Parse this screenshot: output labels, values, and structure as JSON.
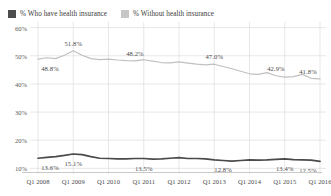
{
  "legend": {
    "items": [
      {
        "label": "% Who have health insurance",
        "color": "#4c4c4c",
        "icon": "square-swatch-icon"
      },
      {
        "label": "% Without health insurance",
        "color": "#c6c6c6",
        "icon": "square-swatch-icon"
      }
    ]
  },
  "axes": {
    "y_ticks": [
      "10%",
      "20%",
      "30%",
      "40%",
      "50%",
      "60%"
    ],
    "x_ticks": [
      "Q1 2008",
      "Q1 2009",
      "Q1 2010",
      "Q1 2011",
      "Q1 2012",
      "Q1 2013",
      "Q1 2014",
      "Q1 2015",
      "Q1 2016"
    ]
  },
  "chart_data": {
    "type": "line",
    "title": "",
    "xlabel": "",
    "ylabel": "",
    "ylim": [
      8,
      62
    ],
    "grid": true,
    "legend_position": "top-left",
    "categories": [
      "Q1 2008",
      "Q2 2008",
      "Q3 2008",
      "Q4 2008",
      "Q1 2009",
      "Q2 2009",
      "Q3 2009",
      "Q4 2009",
      "Q1 2010",
      "Q2 2010",
      "Q3 2010",
      "Q4 2010",
      "Q1 2011",
      "Q2 2011",
      "Q3 2011",
      "Q4 2011",
      "Q1 2012",
      "Q2 2012",
      "Q3 2012",
      "Q4 2012",
      "Q1 2013",
      "Q2 2013",
      "Q3 2013",
      "Q4 2013",
      "Q1 2014",
      "Q2 2014",
      "Q3 2014",
      "Q4 2014",
      "Q1 2015",
      "Q2 2015",
      "Q3 2015",
      "Q4 2015",
      "Q1 2016"
    ],
    "series": [
      {
        "name": "% Without health insurance",
        "color": "#c0c0c0",
        "values": [
          48.8,
          49.3,
          49.0,
          50.2,
          51.8,
          50.2,
          49.0,
          48.6,
          48.8,
          48.5,
          48.3,
          48.2,
          48.6,
          48.1,
          47.6,
          47.5,
          47.8,
          47.4,
          47.0,
          46.8,
          47.0,
          46.2,
          45.4,
          44.5,
          43.6,
          43.4,
          44.0,
          42.9,
          42.4,
          42.6,
          43.4,
          42.0,
          41.8
        ]
      },
      {
        "name": "% Who have health insurance",
        "color": "#4a4a4a",
        "values": [
          13.6,
          13.9,
          14.2,
          14.6,
          15.1,
          14.9,
          14.2,
          13.6,
          13.5,
          13.4,
          13.4,
          13.5,
          13.5,
          13.3,
          13.4,
          13.6,
          13.8,
          13.5,
          13.5,
          13.4,
          13.0,
          12.8,
          12.6,
          12.8,
          13.0,
          12.9,
          13.0,
          13.2,
          13.4,
          13.1,
          13.0,
          12.9,
          12.5
        ]
      }
    ],
    "annotations": [
      {
        "text": "48.8%",
        "series": "% Without health insurance",
        "category": "Q1 2008",
        "value": 48.8
      },
      {
        "text": "51.8%",
        "series": "% Without health insurance",
        "category": "Q1 2009",
        "value": 51.8
      },
      {
        "text": "48.2%",
        "series": "% Without health insurance",
        "category": "Q4 2010",
        "value": 48.2
      },
      {
        "text": "47.0%",
        "series": "% Without health insurance",
        "category": "Q1 2013",
        "value": 47.0
      },
      {
        "text": "42.9%",
        "series": "% Without health insurance",
        "category": "Q4 2014",
        "value": 42.9
      },
      {
        "text": "41.8%",
        "series": "% Without health insurance",
        "category": "Q1 2016",
        "value": 41.8
      },
      {
        "text": "13.6%",
        "series": "% Who have health insurance",
        "category": "Q1 2008",
        "value": 13.6
      },
      {
        "text": "15.1%",
        "series": "% Who have health insurance",
        "category": "Q1 2009",
        "value": 15.1
      },
      {
        "text": "13.5%",
        "series": "% Who have health insurance",
        "category": "Q1 2011",
        "value": 13.5
      },
      {
        "text": "12.8%",
        "series": "% Who have health insurance",
        "category": "Q2 2013",
        "value": 12.8
      },
      {
        "text": "13.4%",
        "series": "% Who have health insurance",
        "category": "Q1 2015",
        "value": 13.4
      },
      {
        "text": "12.5%",
        "series": "% Who have health insurance",
        "category": "Q1 2016",
        "value": 12.5
      }
    ]
  },
  "colors": {
    "gridline": "#dcdcdc",
    "axis_rule": "#c9c9c9",
    "text": "#4a4a4a"
  }
}
